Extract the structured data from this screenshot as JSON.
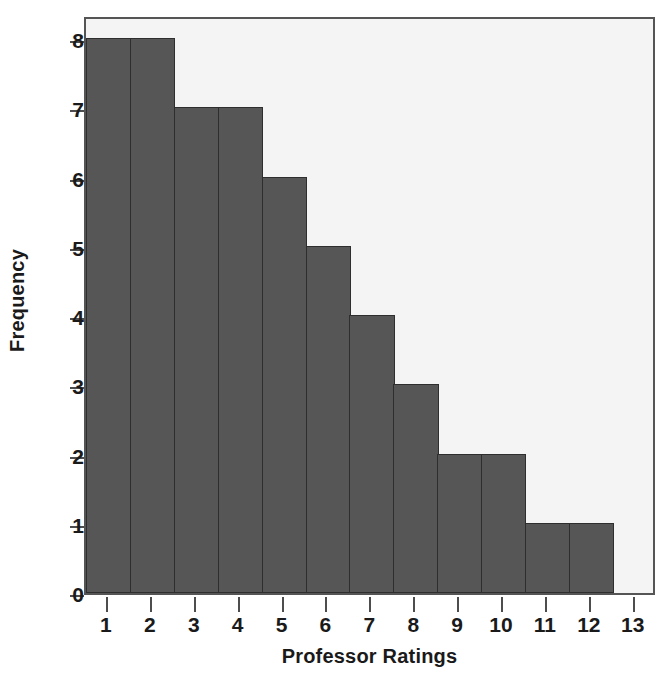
{
  "chart_data": {
    "type": "bar",
    "title": "",
    "subtitle": "",
    "xlabel": "Professor Ratings",
    "ylabel": "Frequency",
    "categories": [
      "1",
      "2",
      "3",
      "4",
      "5",
      "6",
      "7",
      "8",
      "9",
      "10",
      "11",
      "12"
    ],
    "values": [
      8,
      8,
      7,
      7,
      6,
      5,
      4,
      3,
      2,
      2,
      1,
      1
    ],
    "x_tick_labels": [
      "1",
      "2",
      "3",
      "4",
      "5",
      "6",
      "7",
      "8",
      "9",
      "10",
      "11",
      "12",
      "13"
    ],
    "y_tick_labels": [
      "0",
      "1",
      "2",
      "3",
      "4",
      "5",
      "6",
      "7",
      "8"
    ],
    "xlim": [
      0.5,
      13.5
    ],
    "ylim": [
      0,
      8
    ],
    "grid": false,
    "legend": false,
    "legend_position": "none",
    "bin_width": 1,
    "bar_color": "#565656",
    "bar_edge_color": "#2e2e2e",
    "plot_background": "#f4f4f4",
    "axis_color": "#555555",
    "text_color": "#1a1a1a",
    "annotations": []
  }
}
